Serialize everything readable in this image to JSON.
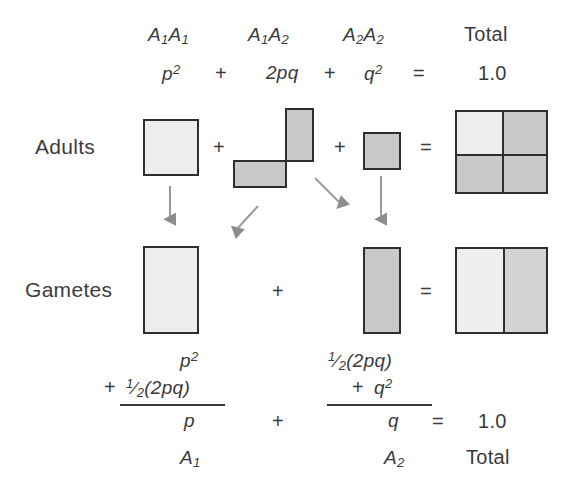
{
  "diagram": {
    "colors": {
      "ink": "#2e2e2e",
      "text": "#3a3a3a",
      "fill_light": "#ededed",
      "fill_dark": "#c9c9c9",
      "arrow": "#8a8a8a",
      "background": "#ffffff"
    }
  },
  "header": {
    "genotypes": [
      {
        "key": "A1A1",
        "allele_a": "A",
        "sub_a": "1",
        "allele_b": "A",
        "sub_b": "1"
      },
      {
        "key": "A1A2",
        "allele_a": "A",
        "sub_a": "1",
        "allele_b": "A",
        "sub_b": "2"
      },
      {
        "key": "A2A2",
        "allele_a": "A",
        "sub_a": "2",
        "allele_b": "A",
        "sub_b": "2"
      }
    ],
    "total_label": "Total",
    "terms": {
      "p_squared_base": "p",
      "p_squared_sup": "2",
      "two_pq": "2pq",
      "q_squared_base": "q",
      "q_squared_sup": "2"
    },
    "operators": {
      "plus1": "+",
      "plus2": "+",
      "equals": "="
    },
    "total_value": "1.0"
  },
  "rows": {
    "adults_label": "Adults",
    "gametes_label": "Gametes"
  },
  "adults_row": {
    "operators": {
      "plus1": "+",
      "plus2": "+",
      "equals": "="
    },
    "shapes": [
      {
        "name": "A1A1-adult-square",
        "shade": "light"
      },
      {
        "name": "A1A2-adult-upper-rect",
        "shade": "dark"
      },
      {
        "name": "A1A2-adult-lower-rect",
        "shade": "dark"
      },
      {
        "name": "A2A2-adult-square",
        "shade": "dark"
      },
      {
        "name": "total-adults-grid",
        "quadrants": [
          "light",
          "dark",
          "dark",
          "dark"
        ]
      }
    ]
  },
  "gametes_row": {
    "operators": {
      "plus1": "+",
      "equals": "="
    },
    "shapes": [
      {
        "name": "p-gamete-rect",
        "shade": "light"
      },
      {
        "name": "q-gamete-rect",
        "shade": "dark"
      },
      {
        "name": "total-gametes-box",
        "halves": [
          "light",
          "dark"
        ]
      }
    ]
  },
  "arrows": [
    {
      "name": "arrow-A1A1-to-p",
      "direction": "down"
    },
    {
      "name": "arrow-A1A2-to-p",
      "direction": "down-left"
    },
    {
      "name": "arrow-A1A2-to-q",
      "direction": "down-right"
    },
    {
      "name": "arrow-A2A2-to-q",
      "direction": "down"
    }
  ],
  "bottom_equation": {
    "left": {
      "numerator_line1": "p",
      "numerator_line1_sup": "2",
      "numerator_plus": "+",
      "numerator_line2_half_num": "1",
      "numerator_line2_half_den": "2",
      "numerator_line2_rest": "(2pq)",
      "denominator": "p",
      "allele_base": "A",
      "allele_sub": "1"
    },
    "middle_operator": "+",
    "right": {
      "numerator_line1_half_num": "1",
      "numerator_line1_half_den": "2",
      "numerator_line1_rest": "(2pq)",
      "numerator_line2_plus": "+",
      "numerator_line2_base": "q",
      "numerator_line2_sup": "2",
      "denominator": "q",
      "allele_base": "A",
      "allele_sub": "2"
    },
    "equals": "=",
    "total_value": "1.0",
    "total_label": "Total"
  }
}
